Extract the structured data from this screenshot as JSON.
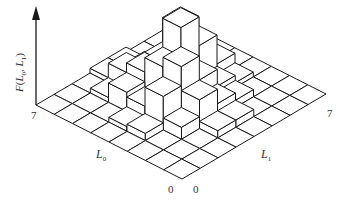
{
  "diagram": {
    "type": "3d-histogram",
    "grid_size": 8,
    "axis_z_label": "F(L0, L1)",
    "axis_z_label_parts": {
      "f": "F",
      "open": "(",
      "a": "L",
      "a_sub": "0",
      "sep": ", ",
      "b": "L",
      "b_sub": "1",
      "close": ")"
    },
    "axis_l0_label": {
      "main": "L",
      "sub": "0"
    },
    "axis_l1_label": {
      "main": "L",
      "sub": "1"
    },
    "ticks": {
      "l0_max": "7",
      "l1_max": "7",
      "l0_min": "0",
      "l1_min": "0"
    },
    "colors": {
      "line": "#1a1a1a",
      "top": "#ffffff",
      "left": "#ffffff",
      "right": "#ffffff",
      "text": "#333333"
    },
    "heights": [
      [
        0,
        0,
        0,
        0,
        0,
        0,
        0,
        0
      ],
      [
        0,
        0,
        0,
        0.3,
        0.3,
        0,
        0,
        0
      ],
      [
        0,
        0,
        0.5,
        1.2,
        0.6,
        0.3,
        0,
        0
      ],
      [
        0,
        0.3,
        1.4,
        2.2,
        1.2,
        0.5,
        0.2,
        0
      ],
      [
        0,
        0.2,
        0.6,
        1.8,
        3.0,
        1.8,
        0.6,
        0
      ],
      [
        0,
        0,
        0.8,
        1.2,
        1.2,
        2.2,
        0.3,
        0
      ],
      [
        0,
        0,
        0.2,
        0.8,
        0.4,
        0.3,
        0.2,
        0
      ],
      [
        0,
        0,
        0,
        0.2,
        0.2,
        0,
        0,
        0
      ]
    ]
  }
}
